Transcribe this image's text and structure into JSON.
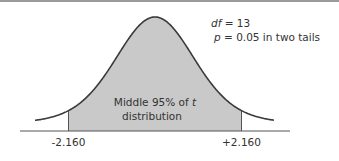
{
  "chart_data": {
    "type": "area",
    "title": "",
    "distribution": "t",
    "df": 13,
    "xlabel": "",
    "ylabel": "",
    "x_range": [
      -4,
      4
    ],
    "critical_values": [
      -2.16,
      2.16
    ],
    "tick_labels": [
      "-2.160",
      "+2.160"
    ],
    "shaded_region": {
      "from": -2.16,
      "to": 2.16,
      "proportion": 0.95
    },
    "region_label_line1": "Middle 95% of ",
    "region_label_var": "t",
    "region_label_line2": "distribution",
    "annotation": {
      "df_var": "df",
      "df_text": " = 13",
      "p_var": "p",
      "p_text": " = 0.05 in two tails"
    },
    "grid": false,
    "legend": "none",
    "colors": {
      "shade": "#c9c9c9",
      "curve": "#3a3a3a",
      "axis": "#555555",
      "top_rule": "#9a9a9a"
    }
  }
}
